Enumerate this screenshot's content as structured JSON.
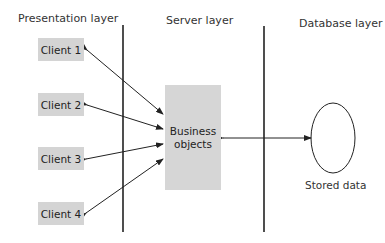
{
  "layers": [
    {
      "title": "Presentation layer"
    },
    {
      "title": "Server layer"
    },
    {
      "title": "Database layer"
    }
  ],
  "clients": [
    {
      "label": "Client 1"
    },
    {
      "label": "Client 2"
    },
    {
      "label": "Client 3"
    },
    {
      "label": "Client 4"
    }
  ],
  "server": {
    "label_line1": "Business",
    "label_line2": "objects"
  },
  "database": {
    "label": "Stored data"
  },
  "colors": {
    "box_fill": "#d4d4d4",
    "line": "#222222"
  }
}
